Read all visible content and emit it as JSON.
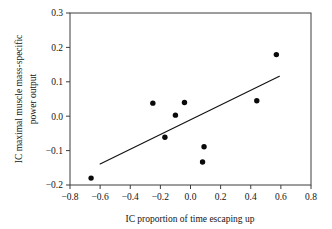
{
  "chart_data": {
    "type": "scatter",
    "title": "",
    "xlabel": "IC proportion of time escaping up",
    "ylabel": "IC maximal muscle mass-specific power output",
    "ylabel_line1": "IC maximal muscle mass-specific",
    "ylabel_line2": "power output",
    "xlim": [
      -0.8,
      0.8
    ],
    "ylim": [
      -0.2,
      0.3
    ],
    "xticks": [
      -0.8,
      -0.6,
      -0.4,
      -0.2,
      0.0,
      0.2,
      0.4,
      0.6,
      0.8
    ],
    "yticks": [
      -0.2,
      -0.1,
      0.0,
      0.1,
      0.2,
      0.3
    ],
    "xtick_labels": [
      "−0.8",
      "−0.6",
      "−0.4",
      "−0.2",
      "0.0",
      "0.2",
      "0.4",
      "0.6",
      "0.8"
    ],
    "ytick_labels": [
      "−0.2",
      "−0.1",
      "0.0",
      "0.1",
      "0.2",
      "0.3"
    ],
    "grid": false,
    "legend": null,
    "point_color": "#0a0a0a",
    "line_color": "#111111",
    "frame_color": "#3d3d3d",
    "points": [
      {
        "x": -0.66,
        "y": -0.18
      },
      {
        "x": -0.25,
        "y": 0.038
      },
      {
        "x": -0.17,
        "y": -0.061
      },
      {
        "x": -0.1,
        "y": 0.003
      },
      {
        "x": -0.04,
        "y": 0.04
      },
      {
        "x": 0.08,
        "y": -0.133
      },
      {
        "x": 0.09,
        "y": -0.089
      },
      {
        "x": 0.44,
        "y": 0.045
      },
      {
        "x": 0.57,
        "y": 0.179
      }
    ],
    "trend_line": {
      "x_start": -0.6,
      "y_start": -0.139,
      "x_end": 0.59,
      "y_end": 0.116
    }
  },
  "axes": {
    "x_title": "IC proportion of time escaping up",
    "y_title_line1": "IC maximal muscle mass-specific",
    "y_title_line2": "power output"
  }
}
